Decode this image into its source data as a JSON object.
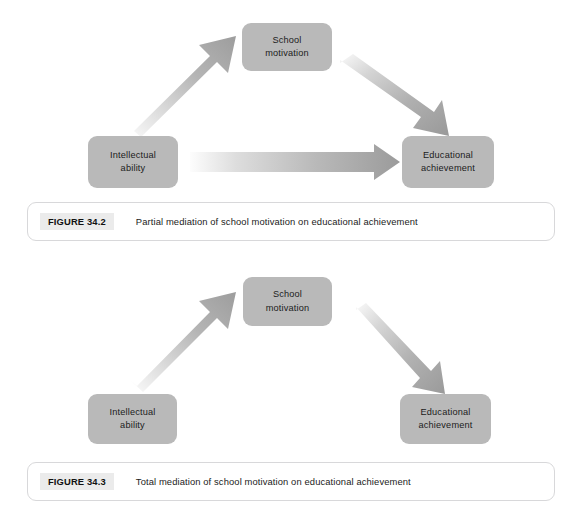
{
  "page": {
    "background": "#ffffff",
    "node_fill": "#b9b9b9",
    "arrow_dark": "#9a9a9a",
    "arrow_light": "#f2f2f2",
    "caption_border": "#d8d8da",
    "caption_tag_bg": "#ebebeb"
  },
  "figures": [
    {
      "id": "figure-34-2",
      "nodes": [
        {
          "id": "school-motivation",
          "lines": [
            "School",
            "motivation"
          ]
        },
        {
          "id": "intellectual-ability",
          "lines": [
            "Intellectual",
            "ability"
          ]
        },
        {
          "id": "educational-achievement",
          "lines": [
            "Educational",
            "achievement"
          ]
        }
      ],
      "arrows": [
        {
          "id": "ability-to-motivation",
          "from": "intellectual-ability",
          "to": "school-motivation",
          "direction": "up-right"
        },
        {
          "id": "motivation-to-achievement",
          "from": "school-motivation",
          "to": "educational-achievement",
          "direction": "down-right"
        },
        {
          "id": "ability-to-achievement",
          "from": "intellectual-ability",
          "to": "educational-achievement",
          "direction": "right"
        }
      ],
      "caption": {
        "tag": "FIGURE 34.2",
        "text": "Partial mediation of school motivation on educational achievement"
      }
    },
    {
      "id": "figure-34-3",
      "nodes": [
        {
          "id": "school-motivation",
          "lines": [
            "School",
            "motivation"
          ]
        },
        {
          "id": "intellectual-ability",
          "lines": [
            "Intellectual",
            "ability"
          ]
        },
        {
          "id": "educational-achievement",
          "lines": [
            "Educational",
            "achievement"
          ]
        }
      ],
      "arrows": [
        {
          "id": "ability-to-motivation",
          "from": "intellectual-ability",
          "to": "school-motivation",
          "direction": "up-right"
        },
        {
          "id": "motivation-to-achievement",
          "from": "school-motivation",
          "to": "educational-achievement",
          "direction": "down-right"
        }
      ],
      "caption": {
        "tag": "FIGURE 34.3",
        "text": "Total mediation of school motivation on educational achievement"
      }
    }
  ]
}
